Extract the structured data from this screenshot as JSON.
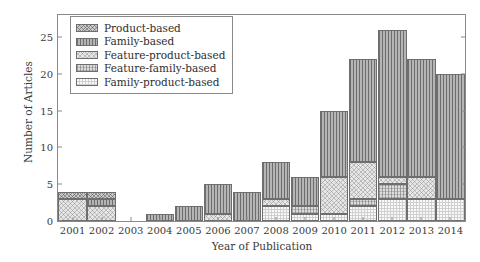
{
  "chart_data": {
    "type": "bar",
    "stacked": true,
    "title": "",
    "xlabel": "Year of Publication",
    "ylabel": "Number of Articles",
    "categories": [
      "2001",
      "2002",
      "2003",
      "2004",
      "2005",
      "2006",
      "2007",
      "2008",
      "2009",
      "2010",
      "2011",
      "2012",
      "2013",
      "2014"
    ],
    "ylim": [
      0,
      28
    ],
    "yticks": [
      0,
      5,
      10,
      15,
      20,
      25
    ],
    "grid": false,
    "legend_position": "top-left",
    "series": [
      {
        "name": "Product-based",
        "key": "product",
        "pattern": "crosshatch-dark",
        "color": "#c9c9c9",
        "values": [
          1,
          1,
          0,
          0,
          0,
          0,
          0,
          0,
          0,
          0,
          0,
          0,
          0,
          0
        ]
      },
      {
        "name": "Family-based",
        "key": "family",
        "pattern": "vertical-lines",
        "color": "#b5b5b5",
        "values": [
          0,
          1,
          0,
          1,
          2,
          4,
          4,
          5,
          4,
          9,
          14,
          20,
          16,
          17
        ]
      },
      {
        "name": "Feature-product-based",
        "key": "featprod",
        "pattern": "crosshatch-light",
        "color": "#e6e6e6",
        "values": [
          3,
          2,
          0,
          0,
          0,
          1,
          0,
          1,
          0,
          5,
          5,
          1,
          3,
          0
        ]
      },
      {
        "name": "Feature-family-based",
        "key": "featfam",
        "pattern": "grid-light",
        "color": "#dcdcdc",
        "values": [
          0,
          0,
          0,
          0,
          0,
          0,
          0,
          0,
          1,
          0,
          1,
          2,
          0,
          0
        ]
      },
      {
        "name": "Family-product-based",
        "key": "famprod",
        "pattern": "dotted",
        "color": "#cfcfcf",
        "values": [
          0,
          0,
          0,
          0,
          0,
          0,
          0,
          2,
          1,
          1,
          2,
          3,
          3,
          3
        ]
      }
    ],
    "totals": [
      4,
      4,
      0,
      1,
      2,
      5,
      4,
      8,
      6,
      15,
      22,
      26,
      22,
      20
    ]
  },
  "legend": {
    "items": [
      {
        "label": "Product-based"
      },
      {
        "label": "Family-based"
      },
      {
        "label": "Feature-product-based"
      },
      {
        "label": "Feature-family-based"
      },
      {
        "label": "Family-product-based"
      }
    ]
  }
}
